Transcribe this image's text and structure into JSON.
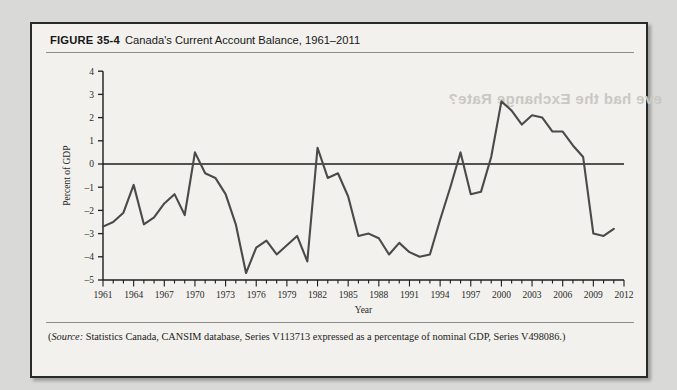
{
  "figure": {
    "number": "FIGURE 35-4",
    "caption": "Canada's Current Account Balance, 1961–2011",
    "ghost_text": "eve had the Exchange Rate?"
  },
  "source": {
    "label": "Source:",
    "text": " Statistics Canada, CANSIM database, Series V113713 expressed as a percentage of nominal GDP, Series V498086.)",
    "open_paren": "("
  },
  "colors": {
    "page_background": "#d9d9d7",
    "panel_background": "#f2f1ed",
    "frame_border": "#2a2a2a",
    "line": "#4a4a4a",
    "axis": "#1c1c1c",
    "text": "#1d1d1d"
  },
  "chart_data": {
    "type": "line",
    "title": "Canada's Current Account Balance, 1961–2011",
    "xlabel": "Year",
    "ylabel": "Percent of GDP",
    "xlim": [
      1961,
      2012
    ],
    "ylim": [
      -5,
      4
    ],
    "yticks": [
      4,
      3,
      2,
      1,
      0,
      -1,
      -2,
      -3,
      -4,
      -5
    ],
    "ytick_labels": [
      "4",
      "3",
      "2",
      "1",
      "0",
      "–1",
      "–2",
      "–3",
      "–4",
      "–5"
    ],
    "xticks": [
      1961,
      1964,
      1967,
      1970,
      1973,
      1976,
      1979,
      1982,
      1985,
      1988,
      1991,
      1994,
      1997,
      2000,
      2003,
      2006,
      2009,
      2012
    ],
    "xtick_labels": [
      "1961",
      "1964",
      "1967",
      "1970",
      "1973",
      "1976",
      "1979",
      "1982",
      "1985",
      "1988",
      "1991",
      "1994",
      "1997",
      "2000",
      "2003",
      "2006",
      "2009",
      "2012"
    ],
    "minor_xtick_interval": 1,
    "grid": false,
    "legend": null,
    "zero_line": true,
    "series": [
      {
        "name": "Current Account Balance (% of GDP)",
        "x": [
          1961,
          1962,
          1963,
          1964,
          1965,
          1966,
          1967,
          1968,
          1969,
          1970,
          1971,
          1972,
          1973,
          1974,
          1975,
          1976,
          1977,
          1978,
          1979,
          1980,
          1981,
          1982,
          1983,
          1984,
          1985,
          1986,
          1987,
          1988,
          1989,
          1990,
          1991,
          1992,
          1993,
          1994,
          1995,
          1996,
          1997,
          1998,
          1999,
          2000,
          2001,
          2002,
          2003,
          2004,
          2005,
          2006,
          2007,
          2008,
          2009,
          2010,
          2011
        ],
        "values": [
          -2.7,
          -2.5,
          -2.1,
          -0.9,
          -2.6,
          -2.3,
          -1.7,
          -1.3,
          -2.2,
          0.5,
          -0.4,
          -0.6,
          -1.3,
          -2.6,
          -4.7,
          -3.6,
          -3.3,
          -3.9,
          -3.5,
          -3.1,
          -4.2,
          0.7,
          -0.6,
          -0.4,
          -1.4,
          -3.1,
          -3.0,
          -3.2,
          -3.9,
          -3.4,
          -3.8,
          -4.0,
          -3.9,
          -2.4,
          -1.0,
          0.5,
          -1.3,
          -1.2,
          0.3,
          2.7,
          2.3,
          1.7,
          2.1,
          2.0,
          1.4,
          1.4,
          0.8,
          0.3,
          -3.0,
          -3.1,
          -2.8
        ]
      }
    ]
  }
}
